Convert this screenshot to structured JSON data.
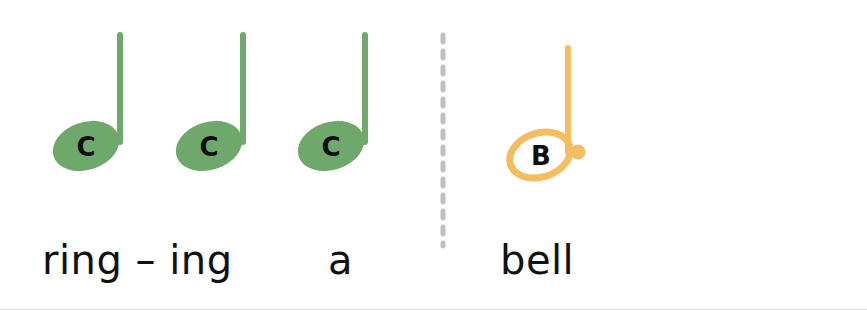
{
  "page": {
    "background_color": "#ffffff",
    "width": 867,
    "height": 310
  },
  "palette": {
    "green_note": "#6FA86B",
    "orange_note": "#F5BD62",
    "note_letter": "#0D0D0D",
    "lyric_text": "#111111",
    "barline": "#BFBFBF",
    "bottom_rule": "#D9D9D9"
  },
  "measures": [
    {
      "index": 1,
      "notes": [
        {
          "id": "note-1",
          "letter": "C",
          "duration": "quarter",
          "notehead": "filled",
          "dotted": false,
          "color": "#6FA86B",
          "cx": 86,
          "cy": 146
        },
        {
          "id": "note-2",
          "letter": "C",
          "duration": "quarter",
          "notehead": "filled",
          "dotted": false,
          "color": "#6FA86B",
          "cx": 209,
          "cy": 146
        },
        {
          "id": "note-3",
          "letter": "C",
          "duration": "quarter",
          "notehead": "filled",
          "dotted": false,
          "color": "#6FA86B",
          "cx": 331,
          "cy": 146
        }
      ]
    },
    {
      "index": 2,
      "notes": [
        {
          "id": "note-4",
          "letter": "B",
          "duration": "dotted-half",
          "notehead": "hollow",
          "dotted": true,
          "color": "#F5BD62",
          "cx": 540,
          "cy": 155
        }
      ]
    }
  ],
  "barline": {
    "name": "dashed-barline",
    "x": 443,
    "y_top": 35,
    "y_bottom": 246,
    "style": "dashed",
    "color": "#BFBFBF"
  },
  "lyrics": [
    {
      "id": "lyric-ringing",
      "text": "ring – ing"
    },
    {
      "id": "lyric-a",
      "text": "a"
    },
    {
      "id": "lyric-bell",
      "text": "bell"
    }
  ]
}
